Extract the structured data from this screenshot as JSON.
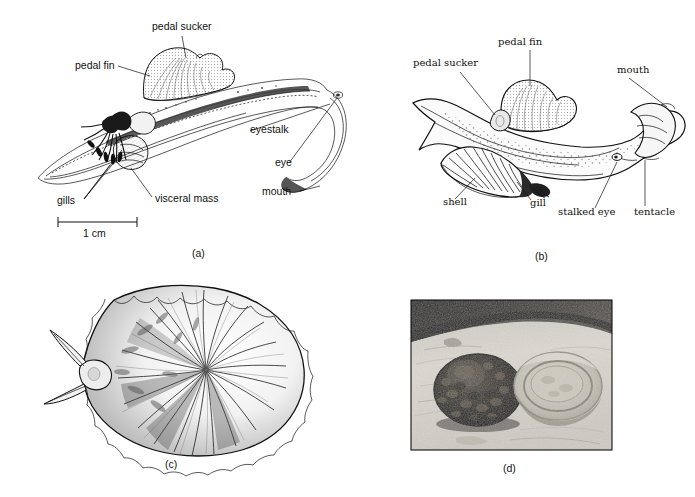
{
  "figure": {
    "type": "scientific-illustration-plate",
    "panel_count": 4,
    "background_color": "#ffffff",
    "ink_color": "#111111"
  },
  "panels": [
    {
      "id": "a",
      "caption": "(a)",
      "subject": "lateral dissection view of a gastropod (heteropod/limpet-like mollusc) showing internal organs",
      "scale_bar": {
        "label": "1 cm",
        "length_px": 79
      },
      "labels": [
        {
          "name": "pedal-sucker",
          "text": "pedal sucker",
          "x": 152,
          "y": 27
        },
        {
          "name": "pedal-fin",
          "text": "pedal fin",
          "x": 75,
          "y": 66
        },
        {
          "name": "eyestalk",
          "text": "eyestalk",
          "x": 250,
          "y": 130
        },
        {
          "name": "eye",
          "text": "eye",
          "x": 275,
          "y": 163
        },
        {
          "name": "mouth",
          "text": "mouth",
          "x": 262,
          "y": 193
        },
        {
          "name": "gills",
          "text": "gills",
          "x": 57,
          "y": 202
        },
        {
          "name": "visceral-mass",
          "text": "visceral mass",
          "x": 155,
          "y": 200
        }
      ]
    },
    {
      "id": "b",
      "caption": "(b)",
      "subject": "whole-animal lateral view showing external features, shell and gill",
      "labels": [
        {
          "name": "pedal-fin",
          "text": "pedal fin",
          "x": 498,
          "y": 42
        },
        {
          "name": "pedal-sucker",
          "text": "pedal sucker",
          "x": 413,
          "y": 63
        },
        {
          "name": "mouth",
          "text": "mouth",
          "x": 617,
          "y": 70
        },
        {
          "name": "shell",
          "text": "shell",
          "x": 443,
          "y": 202
        },
        {
          "name": "gill",
          "text": "gill",
          "x": 530,
          "y": 203
        },
        {
          "name": "stalked-eye",
          "text": "stalked eye",
          "x": 558,
          "y": 212
        },
        {
          "name": "tentacle",
          "text": "tentacle",
          "x": 634,
          "y": 212
        }
      ]
    },
    {
      "id": "c",
      "caption": "(c)",
      "subject": "dorsal view of a ribbed limpet shell with head and two tentacles projecting at left",
      "labels": []
    },
    {
      "id": "d",
      "caption": "(d)",
      "subject": "photograph of a limpet on rock beside its home scar",
      "labels": []
    }
  ],
  "captions": {
    "a": "(a)",
    "b": "(b)",
    "c": "(c)",
    "d": "(d)"
  },
  "scale": {
    "a_bar_text": "1 cm"
  }
}
